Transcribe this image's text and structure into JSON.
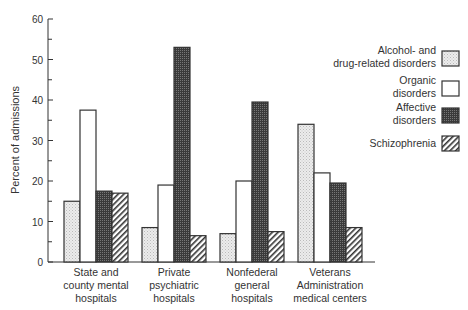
{
  "chart_data": {
    "type": "bar",
    "title": "",
    "xlabel": "",
    "ylabel": "Percent of admissions",
    "ylim": [
      0,
      60
    ],
    "yticks": [
      0,
      10,
      20,
      30,
      40,
      50,
      60
    ],
    "grid": false,
    "legend_position": "right",
    "categories": [
      [
        "State and",
        "county mental",
        "hospitals"
      ],
      [
        "Private",
        "psychiatric",
        "hospitals"
      ],
      [
        "Nonfederal",
        "general",
        "hospitals"
      ],
      [
        "Veterans",
        "Administration",
        "medical centers"
      ]
    ],
    "series": [
      {
        "name": "Alcohol- and drug-related disorders",
        "legend_lines": [
          "Alcohol- and",
          "drug-related  disorders"
        ],
        "pattern": "light-dots",
        "values": [
          15,
          8.5,
          7,
          34
        ]
      },
      {
        "name": "Organic disorders",
        "legend_lines": [
          "Organic",
          "disorders"
        ],
        "pattern": "white",
        "values": [
          37.5,
          19,
          20,
          22
        ]
      },
      {
        "name": "Affective disorders",
        "legend_lines": [
          "Affective",
          "disorders"
        ],
        "pattern": "dark-crosshatch",
        "values": [
          17.5,
          53,
          39.5,
          19.5
        ]
      },
      {
        "name": "Schizophrenia",
        "legend_lines": [
          "Schizophrenia"
        ],
        "pattern": "diagonal-hatch",
        "values": [
          17,
          6.5,
          7.5,
          8.5
        ]
      }
    ]
  }
}
